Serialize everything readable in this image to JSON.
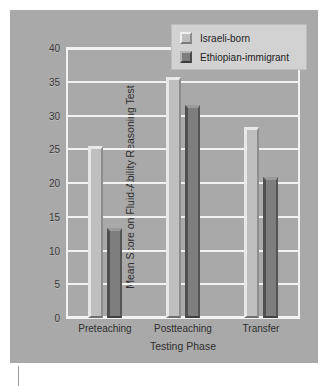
{
  "chart_data": {
    "type": "bar",
    "title": "",
    "xlabel": "Testing Phase",
    "ylabel": "Mean Score on Fluid-Ability Reasoning Test",
    "categories": [
      "Preteaching",
      "Postteaching",
      "Transfer"
    ],
    "series": [
      {
        "name": "Israeli-born",
        "values": [
          25.5,
          35.7,
          28.3
        ],
        "color": "#bfbfbf"
      },
      {
        "name": "Ethiopian-immigrant",
        "values": [
          13.3,
          31.6,
          20.9
        ],
        "color": "#7e7e7e"
      }
    ],
    "ylim": [
      0,
      40
    ],
    "ytick_labels": [
      "0",
      "5",
      "10",
      "15",
      "20",
      "25",
      "30",
      "35",
      "40"
    ],
    "ytick_values": [
      0,
      5,
      10,
      15,
      20,
      25,
      30,
      35,
      40
    ],
    "grid": true,
    "legend_position": "top-right",
    "background_color": "#a9a9a9",
    "grid_color": "#f2f2f2"
  },
  "legend": {
    "items": [
      {
        "label": "Israeli-born",
        "swatch": "light"
      },
      {
        "label": "Ethiopian-immigrant",
        "swatch": "dark"
      }
    ]
  }
}
